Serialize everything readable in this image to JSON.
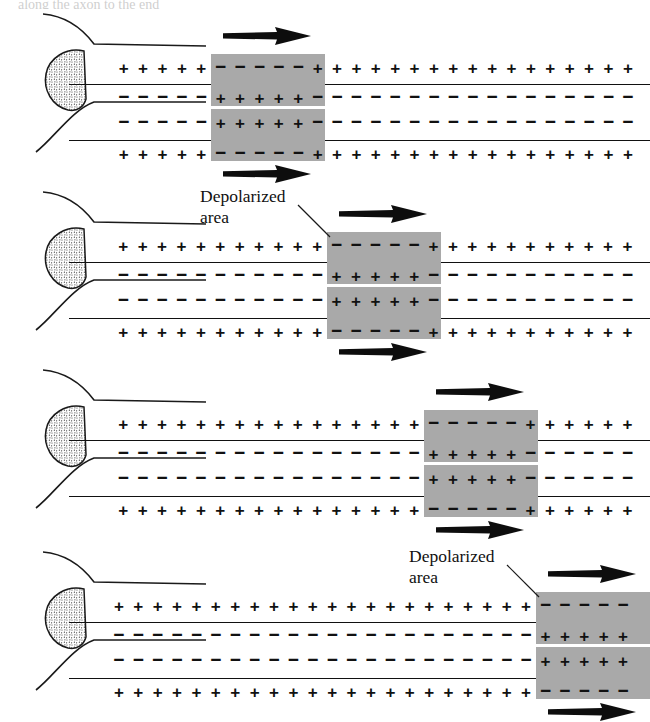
{
  "figure": {
    "truncated_caption_fragment": "along the axon to the end",
    "signs": {
      "positive": "+",
      "negative": "−"
    },
    "colors": {
      "ink": "#111111",
      "depolarized_fill": "#a9a9a9",
      "background": "#ffffff",
      "soma_stipple": "#4a4a4a"
    },
    "labels": {
      "depolarized_line1": "Depolarized",
      "depolarized_line2": "area"
    },
    "panels": [
      {
        "index": 1,
        "name": "stage-1",
        "depolarized_label_visible": false,
        "upper_axon": {
          "outer_row": {
            "lead_sign": "+",
            "lead_count": 5,
            "box_sign": "−",
            "box_count": 5,
            "trail_sign": "+",
            "trail_count": 17
          },
          "inner_row": {
            "lead_sign": "−",
            "lead_count": 5,
            "box_sign": "+",
            "box_count": 5,
            "trail_sign": "−",
            "trail_count": 17
          }
        },
        "lower_axon": {
          "inner_row": {
            "lead_sign": "−",
            "lead_count": 5,
            "box_sign": "+",
            "box_count": 5,
            "trail_sign": "−",
            "trail_count": 17
          },
          "outer_row": {
            "lead_sign": "+",
            "lead_count": 5,
            "box_sign": "−",
            "box_count": 5,
            "trail_sign": "+",
            "trail_count": 17
          }
        },
        "arrow_direction": "right",
        "box_left_px": 211,
        "box_width_px": 114
      },
      {
        "index": 2,
        "name": "stage-2",
        "depolarized_label_visible": true,
        "upper_axon": {
          "outer_row": {
            "lead_sign": "+",
            "lead_count": 11,
            "box_sign": "−",
            "box_count": 5,
            "trail_sign": "+",
            "trail_count": 11
          },
          "inner_row": {
            "lead_sign": "−",
            "lead_count": 11,
            "box_sign": "+",
            "box_count": 5,
            "trail_sign": "−",
            "trail_count": 11
          }
        },
        "lower_axon": {
          "inner_row": {
            "lead_sign": "−",
            "lead_count": 11,
            "box_sign": "+",
            "box_count": 5,
            "trail_sign": "−",
            "trail_count": 11
          },
          "outer_row": {
            "lead_sign": "+",
            "lead_count": 11,
            "box_sign": "−",
            "box_count": 5,
            "trail_sign": "+",
            "trail_count": 11
          }
        },
        "arrow_direction": "right",
        "box_left_px": 327,
        "box_width_px": 114
      },
      {
        "index": 3,
        "name": "stage-3",
        "depolarized_label_visible": false,
        "upper_axon": {
          "outer_row": {
            "lead_sign": "+",
            "lead_count": 16,
            "box_sign": "−",
            "box_count": 5,
            "trail_sign": "+",
            "trail_count": 6
          },
          "inner_row": {
            "lead_sign": "−",
            "lead_count": 16,
            "box_sign": "+",
            "box_count": 5,
            "trail_sign": "−",
            "trail_count": 6
          }
        },
        "lower_axon": {
          "inner_row": {
            "lead_sign": "−",
            "lead_count": 16,
            "box_sign": "+",
            "box_count": 5,
            "trail_sign": "−",
            "trail_count": 6
          },
          "outer_row": {
            "lead_sign": "+",
            "lead_count": 16,
            "box_sign": "−",
            "box_count": 5,
            "trail_sign": "+",
            "trail_count": 6
          }
        },
        "arrow_direction": "right",
        "box_left_px": 424,
        "box_width_px": 114
      },
      {
        "index": 4,
        "name": "stage-4",
        "depolarized_label_visible": true,
        "upper_axon": {
          "outer_row": {
            "lead_sign": "+",
            "lead_count": 22,
            "box_sign": "−",
            "box_count": 5,
            "trail_sign": "+",
            "trail_count": 0
          },
          "inner_row": {
            "lead_sign": "−",
            "lead_count": 22,
            "box_sign": "+",
            "box_count": 5,
            "trail_sign": "−",
            "trail_count": 0
          }
        },
        "lower_axon": {
          "inner_row": {
            "lead_sign": "−",
            "lead_count": 22,
            "box_sign": "+",
            "box_count": 5,
            "trail_sign": "−",
            "trail_count": 0
          },
          "outer_row": {
            "lead_sign": "+",
            "lead_count": 22,
            "box_sign": "−",
            "box_count": 5,
            "trail_sign": "+",
            "trail_count": 0
          }
        },
        "arrow_direction": "right",
        "box_left_px": 536,
        "box_width_px": 114
      }
    ]
  }
}
